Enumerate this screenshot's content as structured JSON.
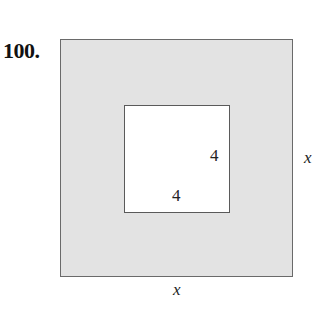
{
  "problem_number": "100.",
  "figure": {
    "outer_square": {
      "side_label_right": "x",
      "side_label_bottom": "x",
      "fill": "#e3e3e3"
    },
    "inner_square": {
      "side_label_right": "4",
      "side_label_bottom": "4",
      "fill": "#ffffff"
    }
  }
}
